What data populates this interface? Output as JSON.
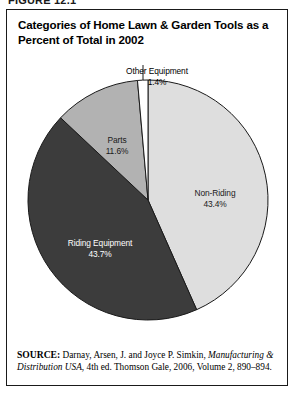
{
  "figure": {
    "number": "FIGURE 12.1",
    "title": "Categories of Home Lawn & Garden Tools as a Percent of Total in 2002"
  },
  "source": {
    "label": "SOURCE:",
    "text_before_italic": " Darnay, Arsen, J. and Joyce P. Simkin, ",
    "italic_title": "Manufacturing & Distribution USA",
    "text_after_italic": ", 4th ed. Thomson Gale, 2006, Volume 2, 890–894."
  },
  "labels": {
    "other": {
      "name": "Other Equipment",
      "value": "1.4%"
    },
    "parts": {
      "name": "Parts",
      "value": "11.6%"
    },
    "nonriding": {
      "name": "Non-Riding",
      "value": "43.4%"
    },
    "riding": {
      "name": "Riding Equipment",
      "value": "43.7%"
    }
  },
  "colors": {
    "non_riding": "#dedede",
    "riding_equipment": "#3c3c3c",
    "parts": "#b2b2b2",
    "other_equipment": "#ffffff",
    "outline": "#1a1a1a",
    "frame": "#1a1a1a",
    "background": "#ffffff"
  },
  "chart_data": {
    "type": "pie",
    "title": "Categories of Home Lawn & Garden Tools as a Percent of Total in 2002",
    "xlabel": "",
    "ylabel": "",
    "units": "percent",
    "start_angle_deg": 0,
    "direction": "clockwise",
    "legend": "none (labels on/near slices)",
    "grid": false,
    "categories": [
      "Non-Riding",
      "Riding Equipment",
      "Parts",
      "Other Equipment"
    ],
    "values": [
      43.4,
      43.7,
      11.6,
      1.4
    ],
    "slices": [
      {
        "label": "Non-Riding",
        "value": 43.4,
        "display": "43.4%",
        "color": "#dedede",
        "label_position": "inside-right"
      },
      {
        "label": "Riding Equipment",
        "value": 43.7,
        "display": "43.7%",
        "color": "#3c3c3c",
        "label_position": "inside-left"
      },
      {
        "label": "Parts",
        "value": 11.6,
        "display": "11.6%",
        "color": "#b2b2b2",
        "label_position": "inside-upper-left"
      },
      {
        "label": "Other Equipment",
        "value": 1.4,
        "display": "1.4%",
        "color": "#ffffff",
        "label_position": "outside-top-callout"
      }
    ],
    "total": 100.1
  }
}
